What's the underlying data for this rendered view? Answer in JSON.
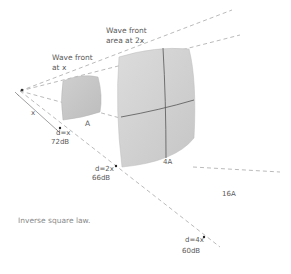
{
  "diagram": {
    "caption": "Inverse square law.",
    "labels": {
      "wavefront_x_line1": "Wave front",
      "wavefront_x_line2": "at x",
      "wavefront_2x_line1": "Wave front",
      "wavefront_2x_line2": "area at 2x",
      "distance_symbol": "x",
      "area_a": "A",
      "area_4a": "4A",
      "area_16a": "16A"
    },
    "measurements": [
      {
        "distance": "d=x",
        "level": "72dB"
      },
      {
        "distance": "d=2x",
        "level": "66dB"
      },
      {
        "distance": "d=4x",
        "level": "60dB"
      }
    ],
    "colors": {
      "wavefront_fill": "#d0d0d0",
      "wavefront_edge": "#b8b8b8",
      "grid_line": "#555555",
      "ray": "#a8a8a8",
      "text": "#5a5a5a",
      "caption": "#8a8a8a"
    }
  }
}
